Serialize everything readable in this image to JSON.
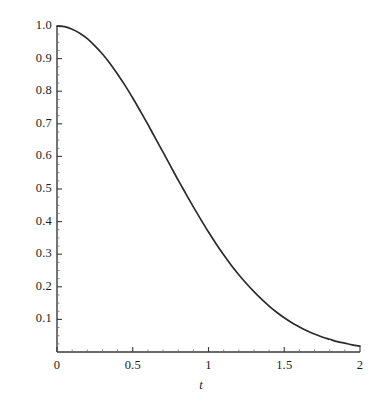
{
  "chart_data": {
    "type": "line",
    "title": "",
    "subtitle": "",
    "xlabel": "t",
    "ylabel": "",
    "xlim": [
      0,
      2
    ],
    "ylim": [
      0,
      1.0
    ],
    "grid": false,
    "legend": null,
    "legend_position": "none",
    "line_color": "#2b2b2b",
    "axis_color": "#3a3a3a",
    "background_color": "#ffffff",
    "xticks": [
      {
        "value": 0,
        "label": "0"
      },
      {
        "value": 0.5,
        "label": "0.5"
      },
      {
        "value": 1,
        "label": "1"
      },
      {
        "value": 1.5,
        "label": "1.5"
      },
      {
        "value": 2,
        "label": "2"
      }
    ],
    "yticks": [
      {
        "value": 0.1,
        "label": "0.1"
      },
      {
        "value": 0.2,
        "label": "0.2"
      },
      {
        "value": 0.3,
        "label": "0.3"
      },
      {
        "value": 0.4,
        "label": "0.4"
      },
      {
        "value": 0.5,
        "label": "0.5"
      },
      {
        "value": 0.6,
        "label": "0.6"
      },
      {
        "value": 0.7,
        "label": "0.7"
      },
      {
        "value": 0.8,
        "label": "0.8"
      },
      {
        "value": 0.9,
        "label": "0.9"
      },
      {
        "value": 1.0,
        "label": "1.0"
      }
    ],
    "x_minor_tick_step": 0.1,
    "y_minor_tick_step": 0.025,
    "series": [
      {
        "name": "curve",
        "x": [
          0.0,
          0.05,
          0.1,
          0.15,
          0.2,
          0.25,
          0.3,
          0.35,
          0.4,
          0.45,
          0.5,
          0.55,
          0.6,
          0.65,
          0.7,
          0.75,
          0.8,
          0.85,
          0.9,
          0.95,
          1.0,
          1.05,
          1.1,
          1.15,
          1.2,
          1.25,
          1.3,
          1.35,
          1.4,
          1.45,
          1.5,
          1.55,
          1.6,
          1.65,
          1.7,
          1.75,
          1.8,
          1.85,
          1.9,
          1.95,
          2.0
        ],
        "y": [
          1.0,
          0.998,
          0.99,
          0.978,
          0.961,
          0.939,
          0.914,
          0.885,
          0.852,
          0.817,
          0.779,
          0.739,
          0.698,
          0.655,
          0.613,
          0.57,
          0.527,
          0.486,
          0.445,
          0.406,
          0.368,
          0.332,
          0.298,
          0.266,
          0.237,
          0.21,
          0.185,
          0.162,
          0.141,
          0.122,
          0.105,
          0.09,
          0.077,
          0.065,
          0.055,
          0.046,
          0.039,
          0.032,
          0.027,
          0.022,
          0.018
        ]
      }
    ]
  },
  "geometry": {
    "plot_left": 57,
    "plot_right": 360,
    "plot_top": 26,
    "plot_bottom": 352
  }
}
